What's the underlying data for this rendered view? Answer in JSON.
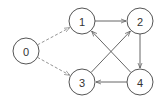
{
  "diagram": {
    "type": "directed-graph",
    "nodes": [
      {
        "id": "0",
        "label": "0",
        "x": 26,
        "y": 51
      },
      {
        "id": "1",
        "label": "1",
        "x": 82,
        "y": 21
      },
      {
        "id": "2",
        "label": "2",
        "x": 140,
        "y": 21
      },
      {
        "id": "3",
        "label": "3",
        "x": 82,
        "y": 82
      },
      {
        "id": "4",
        "label": "4",
        "x": 140,
        "y": 82
      }
    ],
    "edges": [
      {
        "from": "0",
        "to": "1",
        "style": "dashed"
      },
      {
        "from": "0",
        "to": "3",
        "style": "dashed"
      },
      {
        "from": "1",
        "to": "2",
        "style": "solid"
      },
      {
        "from": "2",
        "to": "4",
        "style": "solid"
      },
      {
        "from": "4",
        "to": "3",
        "style": "solid"
      },
      {
        "from": "3",
        "to": "2",
        "style": "solid"
      },
      {
        "from": "4",
        "to": "1",
        "style": "solid"
      }
    ]
  }
}
